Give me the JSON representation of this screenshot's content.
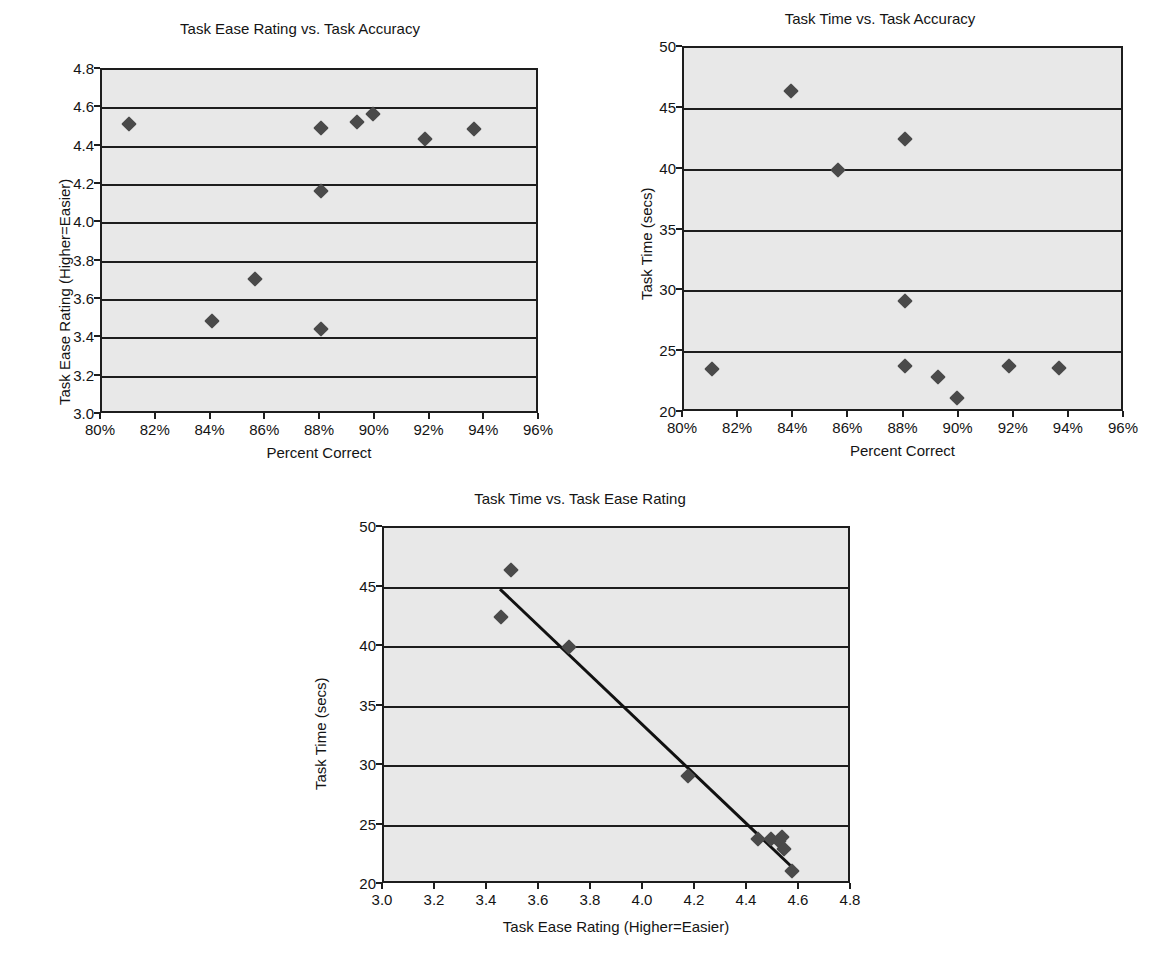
{
  "figure": {
    "background": "#ffffff",
    "plot_background": "#e8e8e8",
    "marker_color": "#4a4a4a",
    "axis_color": "#1d1d1d",
    "trendline_color": "#111111"
  },
  "chart_data": [
    {
      "id": "chart1",
      "type": "scatter",
      "title": "Task Ease Rating vs. Task Accuracy",
      "xlabel": "Percent Correct",
      "ylabel": "Task Ease Rating (Higher=Easier)",
      "xlim": [
        80,
        96
      ],
      "ylim": [
        3.0,
        4.8
      ],
      "xticks": [
        80,
        82,
        84,
        86,
        88,
        90,
        92,
        94,
        96
      ],
      "xticklabels": [
        "80%",
        "82%",
        "84%",
        "86%",
        "88%",
        "90%",
        "92%",
        "94%",
        "96%"
      ],
      "yticks": [
        3.0,
        3.2,
        3.4,
        3.6,
        3.8,
        4.0,
        4.2,
        4.4,
        4.6,
        4.8
      ],
      "yticklabels": [
        "3.0",
        "3.2",
        "3.4",
        "3.6",
        "3.8",
        "4.0",
        "4.2",
        "4.4",
        "4.6",
        "4.8"
      ],
      "grid": "horizontal",
      "legend": "none",
      "trendline": null,
      "points": [
        {
          "x": 81.0,
          "y": 4.52
        },
        {
          "x": 84.0,
          "y": 3.49
        },
        {
          "x": 85.6,
          "y": 3.71
        },
        {
          "x": 88.0,
          "y": 4.5
        },
        {
          "x": 88.0,
          "y": 4.17
        },
        {
          "x": 88.0,
          "y": 3.45
        },
        {
          "x": 89.3,
          "y": 4.53
        },
        {
          "x": 89.9,
          "y": 4.57
        },
        {
          "x": 91.8,
          "y": 4.44
        },
        {
          "x": 93.6,
          "y": 4.49
        }
      ]
    },
    {
      "id": "chart2",
      "type": "scatter",
      "title": "Task Time vs. Task Accuracy",
      "xlabel": "Percent Correct",
      "ylabel": "Task Time (secs)",
      "xlim": [
        80,
        96
      ],
      "ylim": [
        20,
        50
      ],
      "xticks": [
        80,
        82,
        84,
        86,
        88,
        90,
        92,
        94,
        96
      ],
      "xticklabels": [
        "80%",
        "82%",
        "84%",
        "86%",
        "88%",
        "90%",
        "92%",
        "94%",
        "96%"
      ],
      "yticks": [
        20,
        25,
        30,
        35,
        40,
        45,
        50
      ],
      "yticklabels": [
        "20",
        "25",
        "30",
        "35",
        "40",
        "45",
        "50"
      ],
      "grid": "horizontal",
      "legend": "none",
      "trendline": null,
      "points": [
        {
          "x": 81.0,
          "y": 23.6
        },
        {
          "x": 83.9,
          "y": 46.5
        },
        {
          "x": 85.6,
          "y": 40.0
        },
        {
          "x": 88.0,
          "y": 42.5
        },
        {
          "x": 88.0,
          "y": 29.2
        },
        {
          "x": 88.0,
          "y": 23.9
        },
        {
          "x": 89.2,
          "y": 23.0
        },
        {
          "x": 89.9,
          "y": 21.2
        },
        {
          "x": 91.8,
          "y": 23.9
        },
        {
          "x": 93.6,
          "y": 23.7
        }
      ]
    },
    {
      "id": "chart3",
      "type": "scatter",
      "title": "Task Time vs. Task Ease Rating",
      "xlabel": "Task Ease Rating (Higher=Easier)",
      "ylabel": "Task Time (secs)",
      "xlim": [
        3.0,
        4.8
      ],
      "ylim": [
        20,
        50
      ],
      "xticks": [
        3.0,
        3.2,
        3.4,
        3.6,
        3.8,
        4.0,
        4.2,
        4.4,
        4.6,
        4.8
      ],
      "xticklabels": [
        "3.0",
        "3.2",
        "3.4",
        "3.6",
        "3.8",
        "4.0",
        "4.2",
        "4.4",
        "4.6",
        "4.8"
      ],
      "yticks": [
        20,
        25,
        30,
        35,
        40,
        45,
        50
      ],
      "yticklabels": [
        "20",
        "25",
        "30",
        "35",
        "40",
        "45",
        "50"
      ],
      "grid": "horizontal",
      "legend": "none",
      "trendline": {
        "x1": 3.45,
        "y1": 45.0,
        "x2": 4.58,
        "y2": 21.5
      },
      "points": [
        {
          "x": 3.45,
          "y": 42.5
        },
        {
          "x": 3.49,
          "y": 46.5
        },
        {
          "x": 3.71,
          "y": 40.0
        },
        {
          "x": 4.17,
          "y": 29.2
        },
        {
          "x": 4.44,
          "y": 23.9
        },
        {
          "x": 4.49,
          "y": 23.9
        },
        {
          "x": 4.52,
          "y": 23.7
        },
        {
          "x": 4.53,
          "y": 24.0
        },
        {
          "x": 4.54,
          "y": 23.0
        },
        {
          "x": 4.57,
          "y": 21.2
        }
      ]
    }
  ]
}
